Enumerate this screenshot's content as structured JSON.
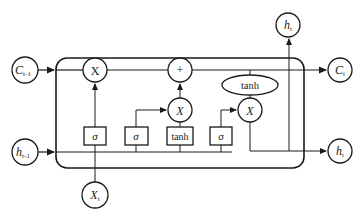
{
  "diagram": {
    "nodes": {
      "c_prev": {
        "label": "C",
        "sub": "t-1"
      },
      "h_prev": {
        "label": "h",
        "sub": "t-1"
      },
      "x_t": {
        "label": "X",
        "sub": "t"
      },
      "c_out": {
        "label": "C",
        "sub": "t"
      },
      "h_out_top": {
        "label": "h",
        "sub": "t"
      },
      "h_out_right": {
        "label": "h",
        "sub": "t"
      },
      "forget_mult": {
        "label": "X"
      },
      "add": {
        "label": "+"
      },
      "input_mult": {
        "label": "X"
      },
      "output_mult": {
        "label": "X"
      },
      "cell_tanh": {
        "label": "tanh"
      }
    },
    "gates": [
      {
        "label": "σ",
        "role": "forget gate"
      },
      {
        "label": "σ",
        "role": "input gate"
      },
      {
        "label": "tanh",
        "role": "candidate"
      },
      {
        "label": "σ",
        "role": "output gate"
      }
    ]
  }
}
